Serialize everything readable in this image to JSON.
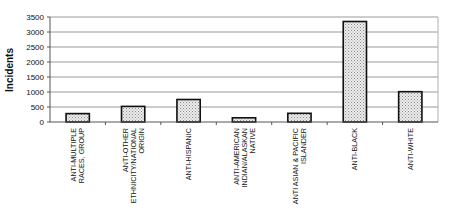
{
  "chart_data": {
    "type": "bar",
    "title": "",
    "xlabel": "",
    "ylabel": "Incidents",
    "ylim": [
      0,
      3500
    ],
    "yticks": [
      0,
      500,
      1000,
      1500,
      2000,
      2500,
      3000,
      3500
    ],
    "grid": true,
    "legend": "none",
    "categories": [
      [
        "ANTI-MULTIPLE",
        "RACES, GROUP"
      ],
      [
        "ANTI-OTHER",
        "ETHNICITY/NATIONAL",
        "ORIGIN"
      ],
      [
        "ANTI-HISPANIC"
      ],
      [
        "ANTI-AMERICAN",
        "INDIAN/ALASKAN",
        "NATIVE"
      ],
      [
        "ANTI ASIAN & PACIFIC",
        "ISLANDER"
      ],
      [
        "ANTI-BLACK"
      ],
      [
        "ANTI-WHITE"
      ]
    ],
    "values": [
      280,
      520,
      750,
      140,
      290,
      3350,
      1010
    ],
    "colors": {
      "bar_fill": "#e6e6e6",
      "bar_dots": "#8a8a8a",
      "bar_stroke": "#111111",
      "grid": "#9a9a9a",
      "axis": "#555555"
    }
  }
}
